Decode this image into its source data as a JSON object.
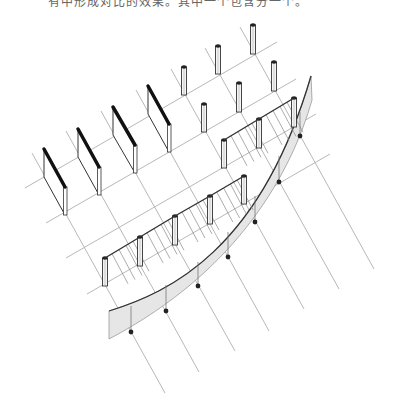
{
  "caption": "有中形成对比的效果。其中一个包含分一个。",
  "diagram": {
    "type": "isometric-architectural-sketch",
    "colors": {
      "grid": "#b8b8b8",
      "ink": "#333333",
      "wall_top": "#111111",
      "band_fill": "#e6e6e6",
      "dot": "#222222"
    },
    "rays": [
      {
        "x1": 32,
        "y1": 153,
        "x2": 165,
        "y2": 393
      },
      {
        "x1": 66,
        "y1": 131,
        "x2": 199,
        "y2": 372
      },
      {
        "x1": 101,
        "y1": 111,
        "x2": 235,
        "y2": 351
      },
      {
        "x1": 136,
        "y1": 90,
        "x2": 269,
        "y2": 331
      },
      {
        "x1": 171,
        "y1": 69,
        "x2": 304,
        "y2": 309
      },
      {
        "x1": 205,
        "y1": 48,
        "x2": 339,
        "y2": 289
      },
      {
        "x1": 240,
        "y1": 27,
        "x2": 374,
        "y2": 269
      }
    ],
    "cross_lines": [
      {
        "x1": 25,
        "y1": 188,
        "x2": 277,
        "y2": 42
      },
      {
        "x1": 46,
        "y1": 223,
        "x2": 296,
        "y2": 79
      },
      {
        "x1": 66,
        "y1": 258,
        "x2": 316,
        "y2": 114
      },
      {
        "x1": 87,
        "y1": 294,
        "x2": 330,
        "y2": 154
      }
    ],
    "walls": [
      {
        "tx": 44,
        "ty": 149,
        "bx": 65,
        "by": 187,
        "h": 28
      },
      {
        "tx": 78,
        "ty": 129,
        "bx": 99,
        "by": 167,
        "h": 28
      },
      {
        "tx": 113,
        "ty": 107,
        "bx": 135,
        "by": 145,
        "h": 28
      },
      {
        "tx": 148,
        "ty": 86,
        "bx": 169,
        "by": 124,
        "h": 28
      }
    ],
    "posts": [
      {
        "x": 184,
        "y": 67,
        "h": 28
      },
      {
        "x": 218,
        "y": 46,
        "h": 28
      },
      {
        "x": 253,
        "y": 25,
        "h": 29
      },
      {
        "x": 204,
        "y": 104,
        "h": 28
      },
      {
        "x": 239,
        "y": 83,
        "h": 29
      },
      {
        "x": 274,
        "y": 62,
        "h": 29
      },
      {
        "x": 224,
        "y": 140,
        "h": 28
      },
      {
        "x": 259,
        "y": 119,
        "h": 29
      },
      {
        "x": 294,
        "y": 98,
        "h": 29
      },
      {
        "x": 105,
        "y": 258,
        "h": 28
      },
      {
        "x": 140,
        "y": 237,
        "h": 29
      },
      {
        "x": 175,
        "y": 216,
        "h": 29
      },
      {
        "x": 210,
        "y": 196,
        "h": 28
      },
      {
        "x": 244,
        "y": 176,
        "h": 28
      }
    ],
    "upper_railing": [
      [
        224,
        140
      ],
      [
        259,
        119
      ],
      [
        294,
        98
      ]
    ],
    "lower_railing": [
      [
        105,
        258
      ],
      [
        140,
        237
      ],
      [
        175,
        216
      ],
      [
        210,
        196
      ],
      [
        244,
        176
      ]
    ],
    "band_dots": [
      [
        131,
        332
      ],
      [
        166,
        311
      ],
      [
        198,
        286
      ],
      [
        228,
        257
      ],
      [
        255,
        222
      ],
      [
        279,
        182
      ],
      [
        300,
        136
      ]
    ]
  }
}
